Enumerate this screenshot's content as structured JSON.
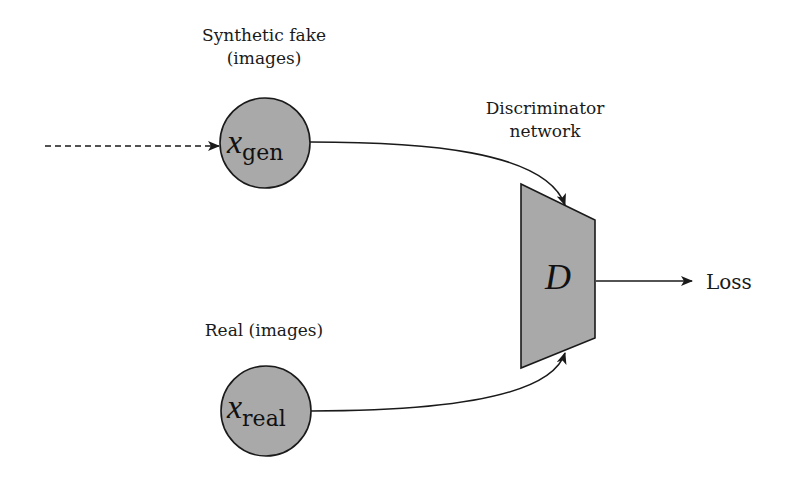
{
  "diagram": {
    "nodes": {
      "x_gen": {
        "caption_line1": "Synthetic fake",
        "caption_line2": "(images)",
        "symbol": "x",
        "subscript": "gen"
      },
      "x_real": {
        "caption": "Real (images)",
        "symbol": "x",
        "subscript": "real"
      },
      "discriminator": {
        "caption_line1": "Discriminator",
        "caption_line2": "network",
        "symbol": "D"
      },
      "loss": {
        "label": "Loss"
      }
    },
    "edges": [
      {
        "from": "input",
        "to": "x_gen",
        "style": "dashed"
      },
      {
        "from": "x_gen",
        "to": "discriminator",
        "style": "solid"
      },
      {
        "from": "x_real",
        "to": "discriminator",
        "style": "solid"
      },
      {
        "from": "discriminator",
        "to": "loss",
        "style": "solid"
      }
    ],
    "colors": {
      "node_fill": "#a9a9a9",
      "stroke": "#1a1a1a",
      "background": "#ffffff"
    }
  }
}
